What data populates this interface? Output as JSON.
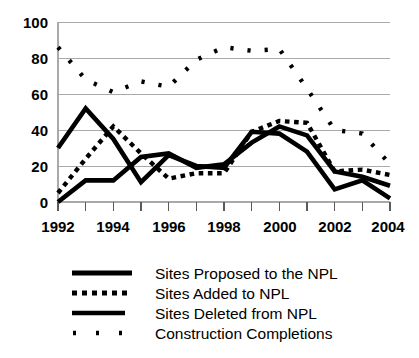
{
  "chart_data": {
    "type": "line",
    "title": "",
    "subtitle": "",
    "xlabel": "",
    "ylabel": "",
    "xlim": [
      1992,
      2004
    ],
    "ylim": [
      0,
      100
    ],
    "yticks": [
      0,
      20,
      40,
      60,
      80,
      100
    ],
    "ytick_labels": [
      "0",
      "20",
      "40",
      "60",
      "80",
      "100"
    ],
    "x": [
      1992,
      1993,
      1994,
      1995,
      1996,
      1997,
      1998,
      1999,
      2000,
      2001,
      2002,
      2003,
      2004
    ],
    "xtick_labels": [
      "1992",
      "",
      "1994",
      "",
      "1996",
      "",
      "1998",
      "",
      "2000",
      "",
      "2002",
      "",
      "2004"
    ],
    "xtick_labels_shown": [
      "1992",
      "1994",
      "1996",
      "1998",
      "2000",
      "2002",
      "2004"
    ],
    "grid": "horizontal",
    "legend_position": "below",
    "series": [
      {
        "name": "Sites Proposed to the NPL",
        "style": "solid-thick",
        "values": [
          30,
          52,
          35,
          11,
          26,
          20,
          19,
          39,
          38,
          28,
          7,
          12,
          2
        ]
      },
      {
        "name": "Sites Added to NPL",
        "style": "dotted-thick",
        "values": [
          5,
          24,
          42,
          27,
          13,
          16,
          16,
          39,
          45,
          44,
          17,
          18,
          15
        ]
      },
      {
        "name": "Sites Deleted from NPL",
        "style": "solid-medium",
        "values": [
          0,
          12,
          12,
          25,
          27,
          19,
          21,
          33,
          42,
          37,
          17,
          14,
          9
        ]
      },
      {
        "name": "Construction Completions",
        "style": "sparse-dotted",
        "values": [
          86,
          68,
          61,
          67,
          64,
          79,
          86,
          84,
          85,
          63,
          40,
          38,
          21
        ]
      }
    ],
    "series_detail": [
      {
        "name": "Sites Proposed to the NPL",
        "points": [
          {
            "x": 1992,
            "y": 30
          },
          {
            "x": 1993,
            "y": 52
          },
          {
            "x": 1994,
            "y": 35
          },
          {
            "x": 1995,
            "y": 11
          },
          {
            "x": 1996,
            "y": 26
          },
          {
            "x": 1997,
            "y": 20
          },
          {
            "x": 1998,
            "y": 19
          },
          {
            "x": 1999,
            "y": 39
          },
          {
            "x": 2000,
            "y": 38
          },
          {
            "x": 2001,
            "y": 28
          },
          {
            "x": 2002,
            "y": 7
          },
          {
            "x": 2003,
            "y": 12
          },
          {
            "x": 2004,
            "y": 2
          }
        ]
      },
      {
        "name": "Sites Added to NPL",
        "points": [
          {
            "x": 1992,
            "y": 5
          },
          {
            "x": 1993,
            "y": 24
          },
          {
            "x": 1994,
            "y": 42
          },
          {
            "x": 1995,
            "y": 27
          },
          {
            "x": 1996,
            "y": 13
          },
          {
            "x": 1997,
            "y": 16
          },
          {
            "x": 1998,
            "y": 16
          },
          {
            "x": 1999,
            "y": 39
          },
          {
            "x": 2000,
            "y": 45
          },
          {
            "x": 2001,
            "y": 44
          },
          {
            "x": 2002,
            "y": 17
          },
          {
            "x": 2003,
            "y": 18
          },
          {
            "x": 2004,
            "y": 15
          }
        ]
      },
      {
        "name": "Sites Deleted from NPL",
        "points": [
          {
            "x": 1992,
            "y": 0
          },
          {
            "x": 1993,
            "y": 12
          },
          {
            "x": 1994,
            "y": 12
          },
          {
            "x": 1995,
            "y": 25
          },
          {
            "x": 1996,
            "y": 27
          },
          {
            "x": 1997,
            "y": 19
          },
          {
            "x": 1998,
            "y": 21
          },
          {
            "x": 1999,
            "y": 33
          },
          {
            "x": 2000,
            "y": 42
          },
          {
            "x": 2001,
            "y": 37
          },
          {
            "x": 2002,
            "y": 17
          },
          {
            "x": 2003,
            "y": 14
          },
          {
            "x": 2004,
            "y": 9
          }
        ]
      },
      {
        "name": "Construction Completions",
        "points": [
          {
            "x": 1992,
            "y": 86
          },
          {
            "x": 1993,
            "y": 68
          },
          {
            "x": 1994,
            "y": 61
          },
          {
            "x": 1995,
            "y": 67
          },
          {
            "x": 1996,
            "y": 64
          },
          {
            "x": 1997,
            "y": 79
          },
          {
            "x": 1998,
            "y": 86
          },
          {
            "x": 1999,
            "y": 84
          },
          {
            "x": 2000,
            "y": 85
          },
          {
            "x": 2001,
            "y": 63
          },
          {
            "x": 2002,
            "y": 40
          },
          {
            "x": 2003,
            "y": 38
          },
          {
            "x": 2004,
            "y": 21
          }
        ]
      }
    ]
  },
  "axis": {
    "y_labels": [
      "100",
      "80",
      "60",
      "40",
      "20",
      "0"
    ],
    "x_labels": [
      "1992",
      "1994",
      "1996",
      "1998",
      "2000",
      "2002",
      "2004"
    ]
  },
  "legend": {
    "items": [
      {
        "label": "Sites Proposed to the NPL",
        "swatch": "solid-thick-line-swatch"
      },
      {
        "label": "Sites Added to NPL",
        "swatch": "dotted-thick-line-swatch"
      },
      {
        "label": "Sites Deleted from NPL",
        "swatch": "solid-medium-line-swatch"
      },
      {
        "label": "Construction Completions",
        "swatch": "sparse-dotted-line-swatch"
      }
    ]
  },
  "colors": {
    "ink": "#000000",
    "grid": "#a9a9a9",
    "background": "#ffffff"
  }
}
